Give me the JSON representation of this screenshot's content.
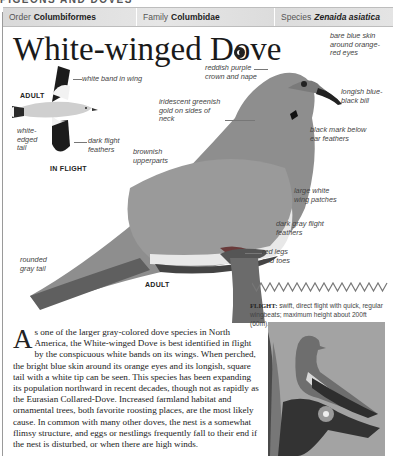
{
  "running_head": "PIGEONS AND DOVES",
  "taxonomy": {
    "order_label": "Order",
    "order_value": "Columbiformes",
    "family_label": "Family",
    "family_value": "Columbidae",
    "species_label": "Species",
    "species_value": "Zenaida asiatica"
  },
  "title": "White-winged Dove",
  "sound_icon": "speaker-icon",
  "in_flight": {
    "adult_label": "ADULT",
    "caption": "IN FLIGHT",
    "labels": [
      "white band in wing",
      "white-edged tail",
      "dark flight feathers"
    ]
  },
  "perched": {
    "adult_label": "ADULT",
    "labels": {
      "crown": "reddish purple crown and nape",
      "eye": "bare blue skin around orange-red eyes",
      "bill": "longish blue-black bill",
      "neck": "iridescent greenish gold on sides of neck",
      "ear": "black mark below ear feathers",
      "upperparts": "brownish upperparts",
      "wing_patch": "large white wing patches",
      "flight_feathers": "dark gray flight feathers",
      "legs": "red legs and toes",
      "tail": "rounded gray tail"
    }
  },
  "flight": {
    "label": "FLIGHT:",
    "text": "swift, direct flight with quick, regular wingbeats; maximum height about 200ft (60m)."
  },
  "description": {
    "dropcap": "A",
    "text": "s one of the larger gray-colored dove species in North America, the White-winged Dove is best identified in flight by the conspicuous white bands on its wings. When perched, the bright blue skin around its orange eyes and its longish, square tail with a white tip can be seen. This species has been expanding its population northward in recent decades, though not as rapidly as the Eurasian Collared-Dove. Increased farmland habitat and ornamental trees, both favorite roosting places, are the most likely cause. In common with many other doves, the nest is a somewhat flimsy structure, and eggs or nestlings frequently fall to their end if the nest is disturbed, or when there are high winds."
  },
  "colors": {
    "taxobar": "#dcdcdc",
    "text": "#222222",
    "photo_bg": "#9d9d9d"
  }
}
